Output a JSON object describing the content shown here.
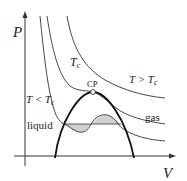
{
  "diagram": {
    "type": "PV phase diagram (van der Waals isotherms)",
    "axes": {
      "y_label": "P",
      "x_label": "V"
    },
    "curves": [
      {
        "name": "isotherm-below-critical",
        "label": "T < T",
        "label_sub": "c"
      },
      {
        "name": "isotherm-critical",
        "label": "T",
        "label_sub": "c"
      },
      {
        "name": "isotherm-above-critical",
        "label": "T > T",
        "label_sub": "c"
      }
    ],
    "critical_point": {
      "label": "CP"
    },
    "regions": {
      "liquid": "liquid",
      "gas": "gas"
    },
    "colors": {
      "line": "#333333",
      "dome": "#111111",
      "fill": "#d0d0d0",
      "background": "#ffffff"
    }
  }
}
